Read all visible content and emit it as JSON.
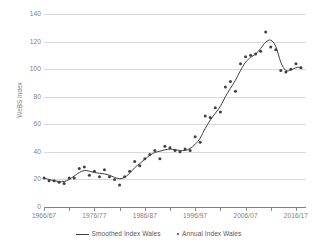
{
  "chart_data": {
    "type": "line",
    "title": "",
    "xlabel": "",
    "ylabel": "WeBS Index",
    "ylim": [
      0,
      140
    ],
    "ytick_values": [
      0,
      20,
      40,
      60,
      80,
      100,
      120,
      140
    ],
    "ytick_labels": [
      "0",
      "20",
      "40",
      "60",
      "80",
      "100",
      "120",
      "140"
    ],
    "grid": "horizontal",
    "legend_position": "bottom",
    "xtick_labels": [
      "1966/67",
      "1976/77",
      "1986/87",
      "1996/97",
      "2006/07",
      "2016/17"
    ],
    "xtick_years": [
      1966,
      1976,
      1986,
      1996,
      2006,
      2016
    ],
    "x_start": 1966,
    "x_end": 2018,
    "x": [
      "1966/67",
      "1967/68",
      "1968/69",
      "1969/70",
      "1970/71",
      "1971/72",
      "1972/73",
      "1973/74",
      "1974/75",
      "1975/76",
      "1976/77",
      "1977/78",
      "1978/79",
      "1979/80",
      "1980/81",
      "1981/82",
      "1982/83",
      "1983/84",
      "1984/85",
      "1985/86",
      "1986/87",
      "1987/88",
      "1988/89",
      "1989/90",
      "1990/91",
      "1991/92",
      "1992/93",
      "1993/94",
      "1994/95",
      "1995/96",
      "1996/97",
      "1997/98",
      "1998/99",
      "1999/00",
      "2000/01",
      "2001/02",
      "2002/03",
      "2003/04",
      "2004/05",
      "2005/06",
      "2006/07",
      "2007/08",
      "2008/09",
      "2009/10",
      "2010/11",
      "2011/12",
      "2012/13",
      "2013/14",
      "2014/15",
      "2015/16",
      "2016/17",
      "2017/18"
    ],
    "series": [
      {
        "name": "Annual Index Wales",
        "style": "markers",
        "color": "#404040",
        "values": [
          21,
          19,
          19,
          18,
          17,
          21,
          21,
          28,
          29,
          23,
          26,
          22,
          27,
          22,
          20,
          16,
          22,
          26,
          33,
          30,
          35,
          38,
          41,
          35,
          44,
          43,
          41,
          40,
          42,
          41,
          51,
          47,
          66,
          65,
          72,
          69,
          87,
          91,
          84,
          104,
          109,
          110,
          111,
          113,
          127,
          116,
          114,
          99,
          98,
          100,
          104,
          101
        ]
      },
      {
        "name": "Smoothed Index Wales",
        "style": "line",
        "color": "#404040",
        "values": [
          21,
          20,
          19,
          18.5,
          18.5,
          20,
          22.5,
          25,
          26.5,
          26,
          25,
          24.5,
          24,
          23,
          21.5,
          20.5,
          21.5,
          24.5,
          28.5,
          31.5,
          34.5,
          37.5,
          39.5,
          40.5,
          41.5,
          42,
          41.5,
          41,
          41,
          42.5,
          45.5,
          50,
          57,
          63,
          68,
          73,
          80,
          86,
          92,
          99,
          105,
          108.5,
          111,
          115,
          119.5,
          121,
          116.5,
          105,
          99,
          99.5,
          101,
          101.5
        ]
      }
    ]
  },
  "legend": {
    "items": [
      {
        "label": "Smoothed Index Wales",
        "marker": "line"
      },
      {
        "label": "Annual Index Wales",
        "marker": "dot"
      }
    ]
  }
}
